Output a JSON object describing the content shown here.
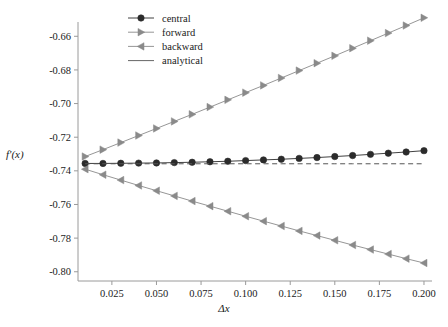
{
  "chart_data": {
    "type": "line",
    "title": "",
    "subtitle": "",
    "xlabel": "Δx",
    "ylabel": "f'(x)",
    "xlim": [
      0.006,
      0.2045
    ],
    "ylim": [
      -0.8055,
      -0.6515
    ],
    "grid": false,
    "legend_position": "top-center",
    "x_ticks": [
      "0.025",
      "0.050",
      "0.075",
      "0.100",
      "0.125",
      "0.150",
      "0.175",
      "0.200"
    ],
    "x_tick_values": [
      0.025,
      0.05,
      0.075,
      0.1,
      0.125,
      0.15,
      0.175,
      0.2
    ],
    "y_ticks": [
      "-0.66",
      "-0.68",
      "-0.70",
      "-0.72",
      "-0.74",
      "-0.76",
      "-0.78",
      "-0.80"
    ],
    "y_tick_values": [
      -0.66,
      -0.68,
      -0.7,
      -0.72,
      -0.74,
      -0.76,
      -0.78,
      -0.8
    ],
    "x": [
      0.01,
      0.02,
      0.03,
      0.04,
      0.05,
      0.06,
      0.07,
      0.08,
      0.09,
      0.1,
      0.11,
      0.12,
      0.13,
      0.14,
      0.15,
      0.16,
      0.17,
      0.18,
      0.19,
      0.2
    ],
    "series": [
      {
        "name": "central",
        "marker": "circle",
        "color": "#2b2b2b",
        "line": "solid",
        "values": [
          -0.7356,
          -0.7356,
          -0.7355,
          -0.7354,
          -0.7353,
          -0.7351,
          -0.7349,
          -0.7346,
          -0.7343,
          -0.7339,
          -0.7335,
          -0.7331,
          -0.7326,
          -0.7321,
          -0.7315,
          -0.7309,
          -0.7302,
          -0.7295,
          -0.7288,
          -0.728
        ]
      },
      {
        "name": "forward",
        "marker": "triangle-right",
        "color": "#8a8a8a",
        "line": "solid",
        "values": [
          -0.7315,
          -0.7274,
          -0.7232,
          -0.719,
          -0.7148,
          -0.7106,
          -0.7064,
          -0.7021,
          -0.6978,
          -0.6935,
          -0.6892,
          -0.6848,
          -0.6804,
          -0.676,
          -0.6716,
          -0.6671,
          -0.6626,
          -0.6581,
          -0.6536,
          -0.649
        ]
      },
      {
        "name": "backward",
        "marker": "triangle-left",
        "color": "#8a8a8a",
        "line": "solid",
        "values": [
          -0.739,
          -0.7423,
          -0.7455,
          -0.7487,
          -0.7518,
          -0.7549,
          -0.758,
          -0.761,
          -0.764,
          -0.767,
          -0.7699,
          -0.7728,
          -0.7757,
          -0.7785,
          -0.7813,
          -0.7841,
          -0.7868,
          -0.7895,
          -0.7922,
          -0.7948
        ]
      },
      {
        "name": "analytical",
        "marker": "none",
        "color": "#555555",
        "line": "dashed",
        "values": [
          -0.7358,
          -0.7358,
          -0.7358,
          -0.7358,
          -0.7358,
          -0.7358,
          -0.7358,
          -0.7358,
          -0.7358,
          -0.7358,
          -0.7358,
          -0.7358,
          -0.7358,
          -0.7358,
          -0.7358,
          -0.7358,
          -0.7358,
          -0.7358,
          -0.7358,
          -0.7358
        ]
      }
    ],
    "legend": [
      "central",
      "forward",
      "backward",
      "analytical"
    ]
  }
}
